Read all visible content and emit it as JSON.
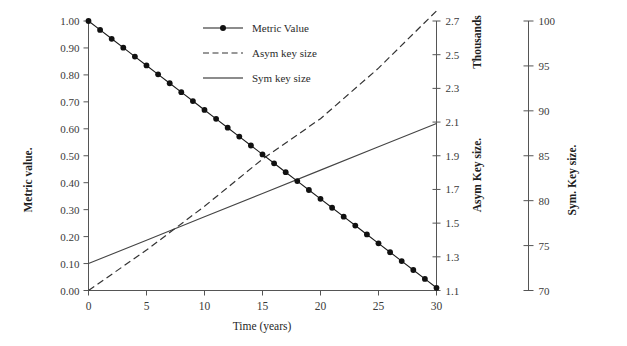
{
  "chart_data": {
    "type": "line",
    "title": "",
    "xlabel": "Time (years)",
    "ylabel": "Metric value.",
    "xlim": [
      0,
      30
    ],
    "xticks": [
      "0",
      "5",
      "10",
      "15",
      "20",
      "25",
      "30"
    ],
    "xtick_values": [
      0,
      5,
      10,
      15,
      20,
      25,
      30
    ],
    "grid": false,
    "legend_position": "top-center-right",
    "axes": [
      {
        "id": "primary-left",
        "label": "Metric value.",
        "side": "left",
        "lim": [
          0.0,
          1.0
        ],
        "ticks": [
          "0.00",
          "0.10",
          "0.20",
          "0.30",
          "0.40",
          "0.50",
          "0.60",
          "0.70",
          "0.80",
          "0.90",
          "1.00"
        ],
        "tick_values": [
          0.0,
          0.1,
          0.2,
          0.3,
          0.4,
          0.5,
          0.6,
          0.7,
          0.8,
          0.9,
          1.0
        ]
      },
      {
        "id": "secondary-asym",
        "label": "Asym Key size.",
        "unit_note": "Thousands",
        "side": "right",
        "lim": [
          1.1,
          2.7
        ],
        "ticks": [
          "1.1",
          "1.3",
          "1.5",
          "1.7",
          "1.9",
          "2.1",
          "2.3",
          "2.5",
          "2.7"
        ],
        "tick_values": [
          1.1,
          1.3,
          1.5,
          1.7,
          1.9,
          2.1,
          2.3,
          2.5,
          2.7
        ]
      },
      {
        "id": "tertiary-sym",
        "label": "Sym. Key size.",
        "side": "right",
        "lim": [
          70,
          100
        ],
        "ticks": [
          "70",
          "75",
          "80",
          "85",
          "90",
          "95",
          "100"
        ],
        "tick_values": [
          70,
          75,
          80,
          85,
          90,
          95,
          100
        ]
      }
    ],
    "series": [
      {
        "name": "Metric Value",
        "axis": "primary-left",
        "style": "line-with-markers",
        "marker": "filled-circle",
        "x": [
          0,
          1,
          2,
          3,
          4,
          5,
          6,
          7,
          8,
          9,
          10,
          11,
          12,
          13,
          14,
          15,
          16,
          17,
          18,
          19,
          20,
          21,
          22,
          23,
          24,
          25,
          26,
          27,
          28,
          29,
          30
        ],
        "values": [
          1.0,
          0.967,
          0.934,
          0.901,
          0.868,
          0.835,
          0.802,
          0.769,
          0.736,
          0.703,
          0.67,
          0.637,
          0.604,
          0.571,
          0.538,
          0.505,
          0.472,
          0.439,
          0.406,
          0.373,
          0.34,
          0.307,
          0.274,
          0.241,
          0.208,
          0.175,
          0.142,
          0.109,
          0.076,
          0.043,
          0.01
        ]
      },
      {
        "name": "Asym key size",
        "axis": "secondary-asym",
        "style": "dashed",
        "x": [
          0,
          5,
          10,
          15,
          20,
          25,
          30
        ],
        "values": [
          1.1,
          1.34,
          1.6,
          1.88,
          2.12,
          2.42,
          2.76
        ]
      },
      {
        "name": "Sym key size",
        "axis": "tertiary-sym",
        "style": "solid",
        "x": [
          0,
          5,
          10,
          15,
          20,
          25,
          30
        ],
        "values": [
          73.0,
          75.6,
          78.2,
          80.8,
          83.4,
          86.0,
          88.6
        ]
      }
    ],
    "legend": [
      {
        "label": "Metric Value",
        "style": "line-with-marker"
      },
      {
        "label": "Asym key size",
        "style": "dashed"
      },
      {
        "label": "Sym key size",
        "style": "solid"
      }
    ]
  }
}
